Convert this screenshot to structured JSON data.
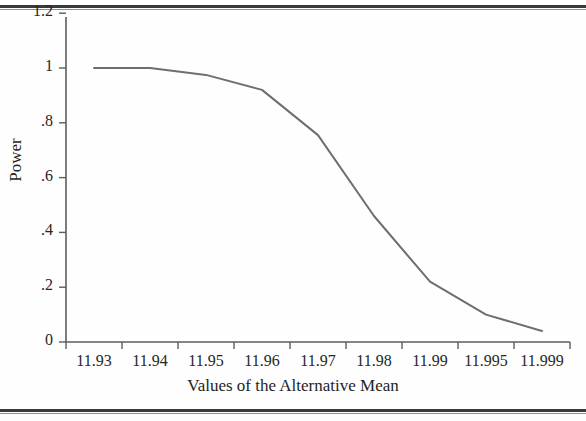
{
  "figure": {
    "background_color": "#fefefe",
    "line_color": "#6e6e6e",
    "axis_color": "#5c5c5c",
    "text_color": "#262626",
    "rule_color": "#3a3a3a"
  },
  "chart_data": {
    "type": "line",
    "title": "",
    "xlabel": "Values of the Alternative Mean",
    "ylabel": "Power",
    "grid": false,
    "legend": null,
    "categories": [
      "11.93",
      "11.94",
      "11.95",
      "11.96",
      "11.97",
      "11.98",
      "11.99",
      "11.995",
      "11.999"
    ],
    "x": [
      11.93,
      11.94,
      11.95,
      11.96,
      11.97,
      11.98,
      11.99,
      11.995,
      11.999
    ],
    "values": [
      1.0,
      1.0,
      0.975,
      0.92,
      0.755,
      0.46,
      0.22,
      0.1,
      0.04
    ],
    "series": [
      {
        "name": "Power",
        "values": [
          1.0,
          1.0,
          0.975,
          0.92,
          0.755,
          0.46,
          0.22,
          0.1,
          0.04
        ]
      }
    ],
    "ylim": [
      0,
      1.2
    ],
    "yticks": [
      0,
      0.2,
      0.4,
      0.6,
      0.8,
      1,
      1.2
    ],
    "ytick_labels": [
      "0",
      ".2",
      ".4",
      ".6",
      ".8",
      "1",
      "1.2"
    ],
    "xtick_labels": [
      "11.93",
      "11.94",
      "11.95",
      "11.96",
      "11.97",
      "11.98",
      "11.99",
      "11.995",
      "11.999"
    ]
  }
}
